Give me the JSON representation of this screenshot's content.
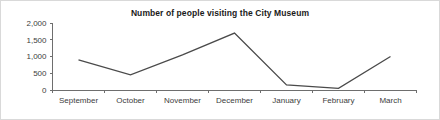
{
  "chart_data": {
    "type": "line",
    "title": "Number of people visiting the City Museum",
    "xlabel": "",
    "ylabel": "",
    "categories": [
      "September",
      "October",
      "November",
      "December",
      "January",
      "February",
      "March"
    ],
    "values": [
      900,
      450,
      1050,
      1700,
      150,
      50,
      1000
    ],
    "series": [
      {
        "name": "Number of people visiting the City Museum",
        "values": [
          900,
          450,
          1050,
          1700,
          150,
          50,
          1000
        ]
      }
    ],
    "ylim": [
      0,
      2000
    ],
    "ytick_values": [
      0,
      500,
      1000,
      1500,
      2000
    ],
    "ytick_labels": [
      "0",
      "500",
      "1,000",
      "1,500",
      "2,000"
    ],
    "grid": false,
    "legend": false,
    "legend_position": "none",
    "markers": false,
    "line_color": "#4a4a4a",
    "axis_color": "#6e6e6e",
    "text_color": "#3d3d3d",
    "title_color": "#1a1a1a",
    "background_color": "#ffffff",
    "border_color": "#d9d9d9"
  }
}
